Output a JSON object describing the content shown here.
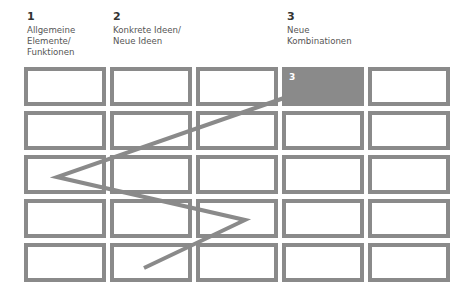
{
  "columns": [
    {
      "number": "1",
      "label": "Allgemeine\nElemente/\nFunktionen",
      "x": 27
    },
    {
      "number": "2",
      "label": "Konkrete Ideen/\nNeue Ideen",
      "x": 113
    },
    {
      "number": "3",
      "label": "Neue\nKombinationen",
      "x": 287
    }
  ],
  "grid": {
    "rows": 5,
    "cols": 5,
    "col_x": [
      24,
      110,
      196,
      282,
      368
    ],
    "row_y": [
      67,
      111,
      155,
      199,
      243
    ],
    "cell_color": "#8a8a8a",
    "highlight": {
      "row": 0,
      "col": 3,
      "label": "3"
    }
  },
  "path": {
    "points": [
      [
        144,
        268
      ],
      [
        245,
        220
      ],
      [
        57,
        177
      ],
      [
        284,
        98
      ]
    ],
    "color": "#8a8a8a",
    "width": 4
  }
}
